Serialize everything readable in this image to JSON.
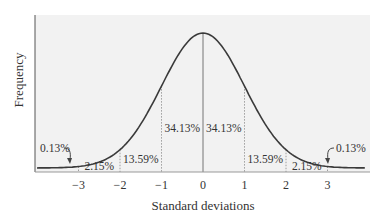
{
  "chart_data": {
    "type": "area",
    "title": "",
    "xlabel": "Standard deviations",
    "ylabel": "Frequency",
    "x_ticks": [
      -3,
      -2,
      -1,
      0,
      1,
      2,
      3
    ],
    "x_tick_labels": [
      "−3",
      "−2",
      "−1",
      "0",
      "1",
      "2",
      "3"
    ],
    "distribution": "normal",
    "mean": 0,
    "sd": 1,
    "regions": [
      {
        "from": "-inf",
        "to": -3,
        "percent": 0.13,
        "label": "0.13%"
      },
      {
        "from": -3,
        "to": -2,
        "percent": 2.15,
        "label": "2.15%"
      },
      {
        "from": -2,
        "to": -1,
        "percent": 13.59,
        "label": "13.59%"
      },
      {
        "from": -1,
        "to": 0,
        "percent": 34.13,
        "label": "34.13%"
      },
      {
        "from": 0,
        "to": 1,
        "percent": 34.13,
        "label": "34.13%"
      },
      {
        "from": 1,
        "to": 2,
        "percent": 13.59,
        "label": "13.59%"
      },
      {
        "from": 2,
        "to": 3,
        "percent": 2.15,
        "label": "2.15%"
      },
      {
        "from": 3,
        "to": "inf",
        "percent": 0.13,
        "label": "0.13%"
      }
    ],
    "grid": false,
    "legend": null,
    "colors": {
      "plot_background": "#f2f2f2",
      "curve": "#3a3a3a",
      "axis": "#555555",
      "divider": "#888888"
    }
  }
}
